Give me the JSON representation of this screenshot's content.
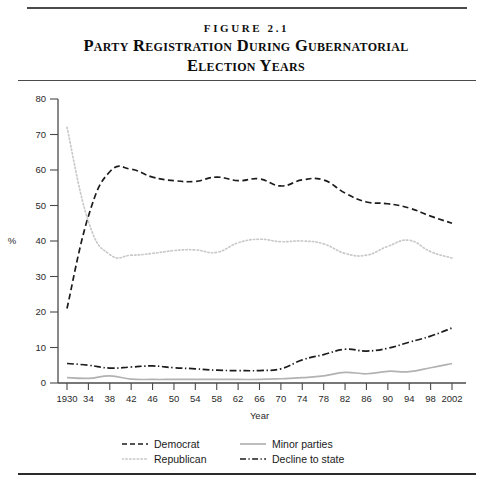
{
  "figure": {
    "label": "FIGURE 2.1",
    "title_line1": "Party Registration During Gubernatorial",
    "title_line2": "Election Years"
  },
  "legend": {
    "position": "bottom",
    "items": [
      {
        "label": "Democrat",
        "style": "dashed",
        "color": "#1c1c1c",
        "icon": "dashed-line-icon"
      },
      {
        "label": "Minor parties",
        "style": "solid",
        "color": "#b2b2b2",
        "icon": "solid-line-icon"
      },
      {
        "label": "Republican",
        "style": "dotted",
        "color": "#c9c9c9",
        "icon": "dotted-line-icon"
      },
      {
        "label": "Decline to state",
        "style": "dash-dot",
        "color": "#1c1c1c",
        "icon": "dash-dot-line-icon"
      }
    ]
  },
  "chart_data": {
    "type": "line",
    "title": "Party Registration During Gubernatorial Election Years",
    "xlabel": "Year",
    "ylabel": "%",
    "xlim": [
      1930,
      2002
    ],
    "ylim": [
      0,
      80
    ],
    "ytick_step": 10,
    "xtick_step": 4,
    "grid": false,
    "legend_position": "bottom",
    "categories": [
      1930,
      1934,
      1938,
      1942,
      1946,
      1950,
      1954,
      1958,
      1962,
      1966,
      1970,
      1974,
      1978,
      1982,
      1986,
      1990,
      1994,
      1998,
      2002
    ],
    "tick_labels": [
      "1930",
      "34",
      "38",
      "42",
      "46",
      "50",
      "54",
      "58",
      "62",
      "66",
      "70",
      "74",
      "78",
      "82",
      "86",
      "90",
      "94",
      "98",
      "2002"
    ],
    "ytick_labels": [
      "0",
      "10",
      "20",
      "30",
      "40",
      "50",
      "60",
      "70",
      "80"
    ],
    "series": [
      {
        "name": "Democrat",
        "style": "dashed",
        "color": "#1c1c1c",
        "values": [
          21.0,
          47.0,
          59.5,
          60.2,
          58.0,
          57.0,
          56.8,
          58.0,
          57.0,
          57.5,
          55.5,
          57.2,
          57.2,
          53.5,
          51.0,
          50.5,
          49.3,
          47.0,
          45.0
        ]
      },
      {
        "name": "Republican",
        "style": "dotted",
        "color": "#c9c9c9",
        "values": [
          72.0,
          45.5,
          36.2,
          36.0,
          36.5,
          37.3,
          37.5,
          36.8,
          39.5,
          40.5,
          39.8,
          40.0,
          39.2,
          36.5,
          36.0,
          38.5,
          40.2,
          37.0,
          35.2
        ]
      },
      {
        "name": "Minor parties",
        "style": "solid",
        "color": "#b2b2b2",
        "values": [
          1.5,
          1.3,
          2.0,
          1.1,
          1.0,
          1.0,
          1.0,
          1.0,
          1.0,
          1.0,
          1.2,
          1.5,
          2.0,
          3.0,
          2.6,
          3.3,
          3.2,
          4.3,
          5.5
        ]
      },
      {
        "name": "Decline to state",
        "style": "dash-dot",
        "color": "#1c1c1c",
        "values": [
          5.5,
          5.0,
          4.2,
          4.5,
          4.8,
          4.3,
          4.0,
          3.6,
          3.5,
          3.5,
          4.0,
          6.5,
          8.0,
          9.5,
          9.0,
          9.8,
          11.5,
          13.2,
          15.5
        ]
      }
    ]
  }
}
